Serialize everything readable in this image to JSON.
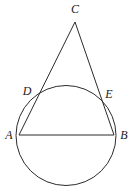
{
  "figure": {
    "background_color": "#ffffff",
    "stroke_color": "#2b2b2b",
    "label_color": "#1a1a1a",
    "stroke_width": 1,
    "canvas": {
      "width": 134,
      "height": 191
    }
  },
  "circle": {
    "name": "main-circle",
    "cx": 66,
    "cy": 135.5,
    "r": 50
  },
  "points": [
    {
      "id": "A",
      "label": "A",
      "x": 19,
      "y": 135,
      "label_x": 9,
      "label_y": 136
    },
    {
      "id": "B",
      "label": "B",
      "x": 114,
      "y": 135,
      "label_x": 124,
      "label_y": 136
    },
    {
      "id": "C",
      "label": "C",
      "x": 75,
      "y": 22,
      "label_x": 75,
      "label_y": 10
    },
    {
      "id": "D",
      "label": "D",
      "x": 37,
      "y": 96,
      "label_x": 27,
      "label_y": 92
    },
    {
      "id": "E",
      "label": "E",
      "x": 98,
      "y": 97,
      "label_x": 109,
      "label_y": 95
    }
  ],
  "segments": [
    {
      "id": "AC",
      "name": "segment-a-to-c",
      "x1": 19,
      "y1": 135,
      "x2": 75,
      "y2": 22
    },
    {
      "id": "BC",
      "name": "segment-b-to-c",
      "x1": 114,
      "y1": 135,
      "x2": 75,
      "y2": 22
    },
    {
      "id": "AB",
      "name": "segment-a-to-b",
      "x1": 19,
      "y1": 135,
      "x2": 114,
      "y2": 135
    }
  ],
  "labels": {
    "A": "A",
    "B": "B",
    "C": "C",
    "D": "D",
    "E": "E"
  }
}
